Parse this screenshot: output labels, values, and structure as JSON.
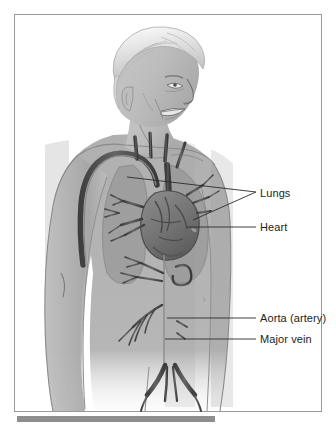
{
  "figure": {
    "frame": {
      "border_color": "#9a9a9a",
      "background_color": "#ffffff"
    },
    "footer_bar": {
      "color": "#8e8e8e"
    }
  },
  "palette": {
    "skin_light": "#d6d6d6",
    "skin_mid": "#b0b0b0",
    "skin_shadow": "#949494",
    "hair_white": "#f2f2f2",
    "hair_gray": "#c9c9c9",
    "lung_fill": "#9b9b9b",
    "vessel_dark": "#4a4a4a",
    "vessel_mid": "#6a6a6a",
    "heart_fill": "#7d7d7d",
    "outline": "#5a5a5a",
    "label_color": "#1c1c1c",
    "leader_color": "#2b2b2b"
  },
  "labels": [
    {
      "id": "lungs",
      "text": "Lungs",
      "x": 245,
      "y": 172,
      "leader": "forked"
    },
    {
      "id": "heart",
      "text": "Heart",
      "x": 245,
      "y": 206,
      "leader": "straight"
    },
    {
      "id": "aorta",
      "text": "Aorta (artery)",
      "x": 245,
      "y": 297,
      "leader": "straight"
    },
    {
      "id": "vein",
      "text": "Major vein",
      "x": 245,
      "y": 318,
      "leader": "straight"
    }
  ],
  "anatomy_parts": [
    "head",
    "face",
    "hair",
    "neck",
    "left-arm",
    "right-arm",
    "torso",
    "left-lung",
    "right-lung",
    "heart",
    "aortic-arch",
    "ascending-aorta",
    "descending-aorta",
    "superior-vena-cava",
    "inferior-vena-cava",
    "pulmonary-arteries",
    "renal-arteries",
    "iliac-bifurcation"
  ]
}
